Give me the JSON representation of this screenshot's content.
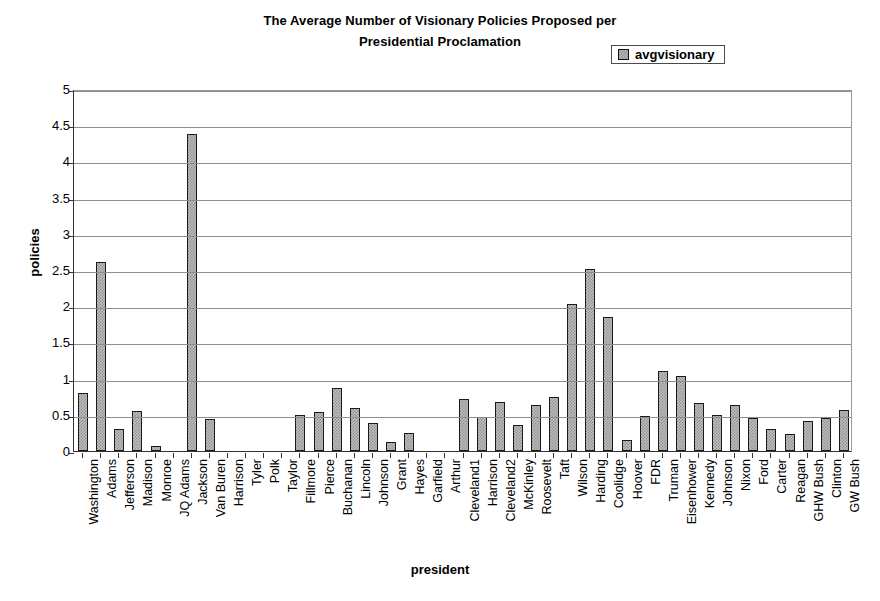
{
  "chart_data": {
    "type": "bar",
    "title": "The Average Number of Visionary Policies Proposed per Presidential Proclamation",
    "title_lines": [
      "The Average Number of Visionary Policies Proposed per",
      "Presidential Proclamation"
    ],
    "xlabel": "president",
    "ylabel": "policies",
    "ylim": [
      0,
      5
    ],
    "ytick_step": 0.5,
    "yticks": [
      "5",
      "4.5",
      "4",
      "3.5",
      "3",
      "2.5",
      "2",
      "1.5",
      "1",
      "0.5",
      "0"
    ],
    "ytick_values": [
      5,
      4.5,
      4,
      3.5,
      3,
      2.5,
      2,
      1.5,
      1,
      0.5,
      0
    ],
    "grid": true,
    "legend": {
      "position": "top-right",
      "entries": [
        "avgvisionary"
      ]
    },
    "series_name": "avgvisionary",
    "bar_fill_color": "#bdbdbd",
    "bar_edge_color": "#1a1a1a",
    "categories": [
      "Washington",
      "Adams",
      "Jefferson",
      "Madison",
      "Monroe",
      "JQ Adams",
      "Jackson",
      "Van Buren",
      "Harrison",
      "Tyler",
      "Polk",
      "Taylor",
      "Fillmore",
      "Pierce",
      "Buchanan",
      "Lincoln",
      "Johnson",
      "Grant",
      "Hayes",
      "Garfield",
      "Arthur",
      "Cleveland1",
      "Harrison",
      "Cleveland2",
      "McKinley",
      "Roosevelt",
      "Taft",
      "Wilson",
      "Harding",
      "Coolidge",
      "Hoover",
      "FDR",
      "Truman",
      "Eisenhower",
      "Kennedy",
      "Johnson",
      "Nixon",
      "Ford",
      "Carter",
      "Reagan",
      "GHW Bush",
      "Clinton",
      "GW Bush"
    ],
    "values": [
      0.8,
      2.61,
      0.31,
      0.55,
      0.07,
      0.0,
      4.38,
      0.44,
      0.0,
      0.0,
      0.0,
      0.0,
      0.5,
      0.54,
      0.87,
      0.6,
      0.39,
      0.13,
      0.25,
      0.0,
      0.0,
      0.72,
      0.47,
      0.68,
      0.36,
      0.64,
      0.75,
      2.03,
      2.52,
      1.85,
      0.15,
      0.49,
      1.11,
      1.03,
      0.66,
      0.5,
      0.64,
      0.45,
      0.31,
      0.24,
      0.41,
      0.46,
      0.56
    ]
  }
}
